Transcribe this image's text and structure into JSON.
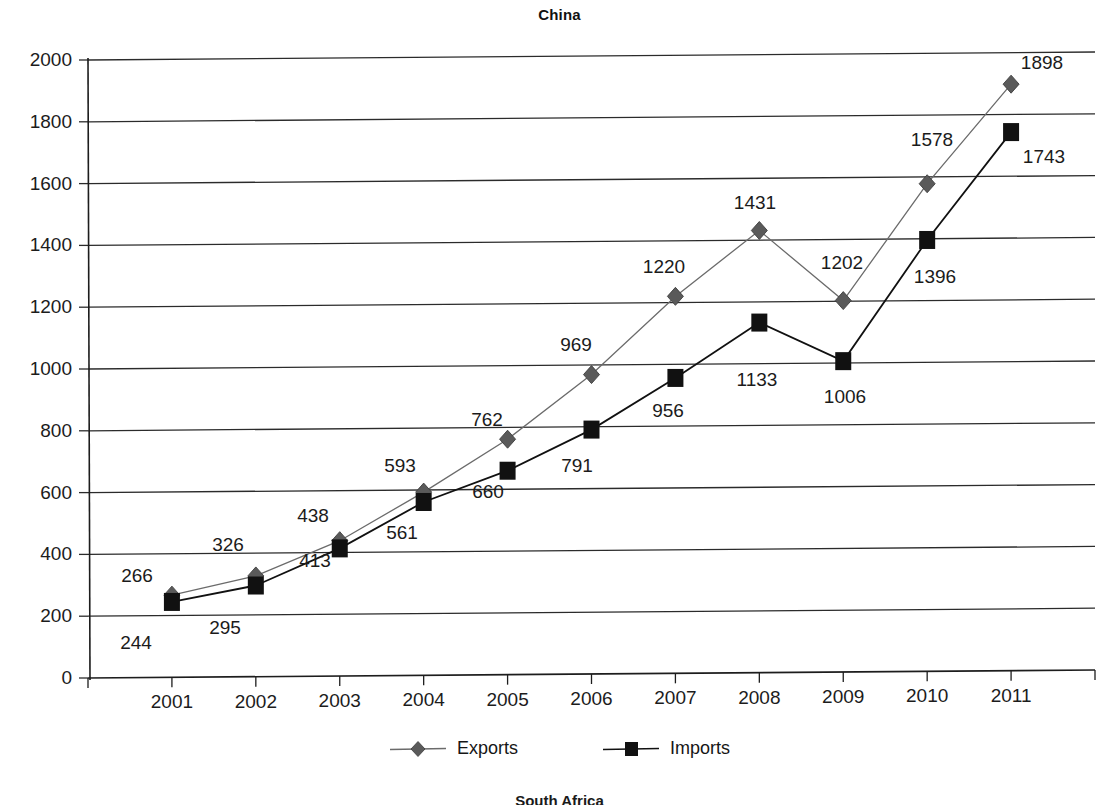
{
  "figure": {
    "title": "China",
    "next_figure_title": "South Africa"
  },
  "legend": {
    "items": [
      {
        "label": "Exports",
        "marker": "diamond-marker",
        "color": "#5a5a5a"
      },
      {
        "label": "Imports",
        "marker": "square-marker",
        "color": "#111111"
      }
    ]
  },
  "axes": {
    "y_ticks": [
      "0",
      "200",
      "400",
      "600",
      "800",
      "1000",
      "1200",
      "1400",
      "1600",
      "1800",
      "2000"
    ],
    "x_ticks": [
      "2001",
      "2002",
      "2003",
      "2004",
      "2005",
      "2006",
      "2007",
      "2008",
      "2009",
      "2010",
      "2011"
    ]
  },
  "chart_data": {
    "type": "line",
    "title": "China",
    "xlabel": "",
    "ylabel": "",
    "ylim": [
      0,
      2000
    ],
    "ytick_step": 200,
    "grid": true,
    "legend_position": "bottom",
    "categories": [
      "2001",
      "2002",
      "2003",
      "2004",
      "2005",
      "2006",
      "2007",
      "2008",
      "2009",
      "2010",
      "2011"
    ],
    "series": [
      {
        "name": "Exports",
        "marker": "diamond",
        "color": "#5a5a5a",
        "values": [
          266,
          326,
          438,
          593,
          762,
          969,
          1220,
          1431,
          1202,
          1578,
          1898
        ],
        "labels": [
          "266",
          "326",
          "438",
          "593",
          "762",
          "969",
          "1220",
          "1431",
          "1202",
          "1578",
          "1898"
        ]
      },
      {
        "name": "Imports",
        "marker": "square",
        "color": "#111111",
        "values": [
          244,
          295,
          413,
          561,
          660,
          791,
          956,
          1133,
          1006,
          1396,
          1743
        ],
        "labels": [
          "244",
          "295",
          "413",
          "561",
          "660",
          "791",
          "956",
          "1133",
          "1006",
          "1396",
          "1743"
        ]
      }
    ]
  },
  "label_positions": {
    "exports": [
      {
        "x": 137,
        "y": 576
      },
      {
        "x": 228,
        "y": 545
      },
      {
        "x": 313,
        "y": 516
      },
      {
        "x": 400,
        "y": 466
      },
      {
        "x": 487,
        "y": 420
      },
      {
        "x": 576,
        "y": 345
      },
      {
        "x": 664,
        "y": 267
      },
      {
        "x": 755,
        "y": 203
      },
      {
        "x": 842,
        "y": 263
      },
      {
        "x": 932,
        "y": 140
      },
      {
        "x": 1042,
        "y": 63
      }
    ],
    "imports": [
      {
        "x": 136,
        "y": 643
      },
      {
        "x": 225,
        "y": 628
      },
      {
        "x": 315,
        "y": 561
      },
      {
        "x": 402,
        "y": 533
      },
      {
        "x": 488,
        "y": 492
      },
      {
        "x": 577,
        "y": 466
      },
      {
        "x": 668,
        "y": 411
      },
      {
        "x": 757,
        "y": 380
      },
      {
        "x": 845,
        "y": 397
      },
      {
        "x": 935,
        "y": 277
      },
      {
        "x": 1044,
        "y": 157
      }
    ]
  }
}
